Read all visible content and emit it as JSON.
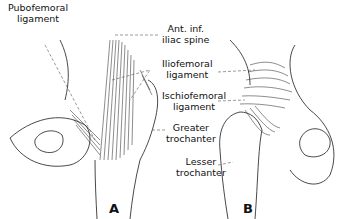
{
  "figure": {
    "labels": {
      "pubofemoral": [
        "Pubofemoral",
        "ligament"
      ],
      "ant_inf_iliac": [
        "Ant. inf.",
        "iliac spine"
      ],
      "iliofemoral": [
        "Iliofemoral",
        "ligament"
      ],
      "ischiofemoral": [
        "Ischiofemoral",
        "ligament"
      ],
      "greater_trochanter": [
        "Greater",
        "trochanter"
      ],
      "lesser_trochanter": [
        "Lesser",
        "trochanter"
      ]
    },
    "panels": {
      "a": "A",
      "b": "B"
    },
    "colors": {
      "line": "#1a1a1a",
      "leader": "#555555",
      "background": "#ffffff"
    }
  }
}
